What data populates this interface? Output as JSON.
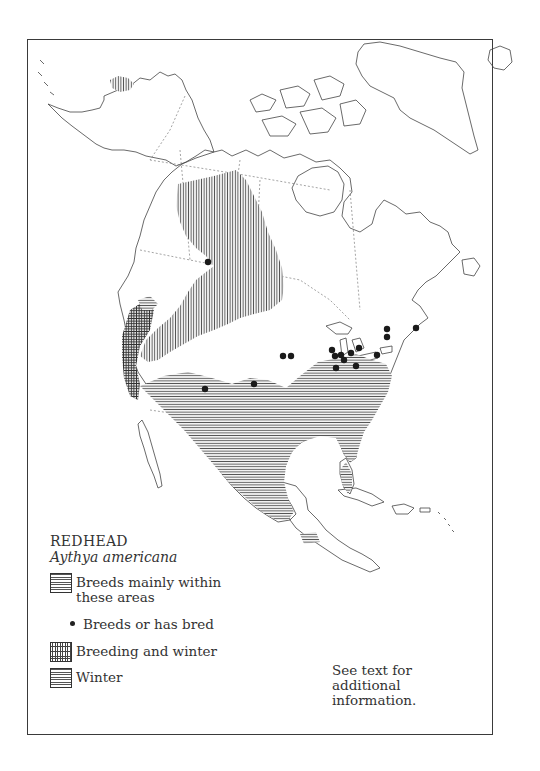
{
  "figure": {
    "title": "REDHEAD",
    "species": "Aythya americana",
    "note": "See text for additional information."
  },
  "legend": [
    {
      "key": "breeding",
      "pattern": "vertical-hatch-swatch-shown-horizontal",
      "label": "Breeds mainly within these areas"
    },
    {
      "key": "bred-record",
      "pattern": "dot",
      "label": "Breeds or has bred"
    },
    {
      "key": "breeding-and-winter",
      "pattern": "crosshatch",
      "label": "Breeding and winter"
    },
    {
      "key": "winter",
      "pattern": "horizontal-hatch",
      "label": "Winter"
    }
  ],
  "map": {
    "region": "North America",
    "patterns": {
      "breeding": "vertical lines",
      "breeding_and_winter": "crosshatch",
      "winter": "horizontal lines"
    },
    "colors": {
      "ink": "#2a2a2a",
      "paper": "#ffffff",
      "hatch": "#555555"
    },
    "breeding_records": [
      [
        208,
        262
      ],
      [
        287,
        356
      ],
      [
        293,
        356
      ],
      [
        255,
        383
      ],
      [
        205,
        389
      ],
      [
        333,
        350
      ],
      [
        336,
        356
      ],
      [
        343,
        356
      ],
      [
        349,
        359
      ],
      [
        355,
        350
      ],
      [
        362,
        347
      ],
      [
        343,
        367
      ],
      [
        354,
        365
      ],
      [
        376,
        354
      ],
      [
        387,
        338
      ],
      [
        388,
        343
      ],
      [
        416,
        328
      ]
    ]
  }
}
